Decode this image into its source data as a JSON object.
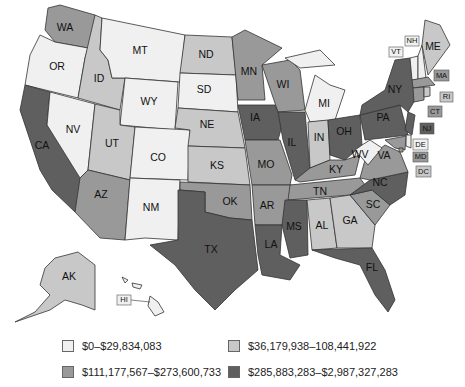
{
  "colors": {
    "tier1": "#f0f0f0",
    "tier2": "#c8c8c8",
    "tier3": "#999999",
    "tier4": "#5f5f5f"
  },
  "legend": [
    {
      "label": "$0–$29,834,083",
      "tier": "tier1"
    },
    {
      "label": "$36,179,938–108,441,922",
      "tier": "tier2"
    },
    {
      "label": "$111,177,567–$273,600,733",
      "tier": "tier3"
    },
    {
      "label": "$285,883,283–$2,987,327,283",
      "tier": "tier4"
    }
  ],
  "states": {
    "WA": "tier3",
    "OR": "tier1",
    "CA": "tier4",
    "ID": "tier2",
    "NV": "tier1",
    "MT": "tier1",
    "WY": "tier1",
    "UT": "tier2",
    "AZ": "tier3",
    "CO": "tier1",
    "NM": "tier1",
    "ND": "tier2",
    "SD": "tier1",
    "NE": "tier2",
    "KS": "tier2",
    "OK": "tier3",
    "TX": "tier4",
    "MN": "tier3",
    "IA": "tier4",
    "MO": "tier3",
    "AR": "tier3",
    "LA": "tier4",
    "WI": "tier3",
    "IL": "tier4",
    "MS": "tier4",
    "MI": "tier1",
    "IN": "tier2",
    "OH": "tier4",
    "KY": "tier3",
    "TN": "tier3",
    "AL": "tier2",
    "GA": "tier2",
    "FL": "tier4",
    "SC": "tier3",
    "NC": "tier4",
    "VA": "tier3",
    "WV": "tier1",
    "PA": "tier4",
    "NY": "tier4",
    "ME": "tier2",
    "VT": "tier1",
    "NH": "tier1",
    "MA": "tier3",
    "RI": "tier2",
    "CT": "tier3",
    "NJ": "tier4",
    "DE": "tier1",
    "MD": "tier3",
    "DC": "tier3",
    "AK": "tier2",
    "HI": "tier1"
  },
  "labels": {
    "WA": "WA",
    "OR": "OR",
    "CA": "CA",
    "ID": "ID",
    "NV": "NV",
    "MT": "MT",
    "WY": "WY",
    "UT": "UT",
    "AZ": "AZ",
    "CO": "CO",
    "NM": "NM",
    "ND": "ND",
    "SD": "SD",
    "NE": "NE",
    "KS": "KS",
    "OK": "OK",
    "TX": "TX",
    "MN": "MN",
    "IA": "IA",
    "MO": "MO",
    "AR": "AR",
    "LA": "LA",
    "WI": "WI",
    "IL": "IL",
    "MS": "MS",
    "MI": "MI",
    "IN": "IN",
    "OH": "OH",
    "KY": "KY",
    "TN": "TN",
    "AL": "AL",
    "GA": "GA",
    "FL": "FL",
    "SC": "SC",
    "NC": "NC",
    "VA": "VA",
    "WV": "WV",
    "PA": "PA",
    "NY": "NY",
    "ME": "ME",
    "VT": "VT",
    "NH": "NH",
    "MA": "MA",
    "RI": "RI",
    "CT": "CT",
    "NJ": "NJ",
    "DE": "DE",
    "MD": "MD",
    "DC": "DC",
    "AK": "AK",
    "HI": "HI"
  }
}
